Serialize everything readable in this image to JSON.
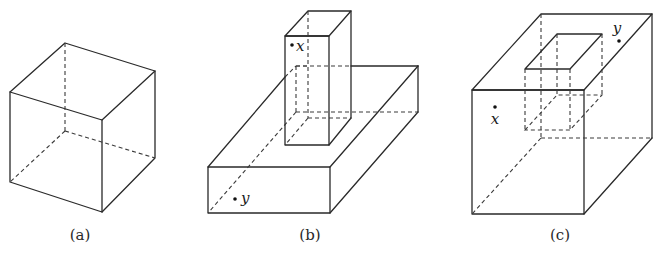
{
  "figure": {
    "panels": [
      {
        "id": "a",
        "label": "(a)",
        "description": "cube"
      },
      {
        "id": "b",
        "label": "(b)",
        "description": "rectangular prism standing on a flat slab",
        "points": [
          {
            "name": "x"
          },
          {
            "name": "y"
          }
        ]
      },
      {
        "id": "c",
        "label": "(c)",
        "description": "cube with a rectangular hole cut into the top",
        "points": [
          {
            "name": "x"
          },
          {
            "name": "y"
          }
        ]
      }
    ],
    "colors": {
      "line": "#2a2a2a",
      "background": "#ffffff"
    }
  }
}
